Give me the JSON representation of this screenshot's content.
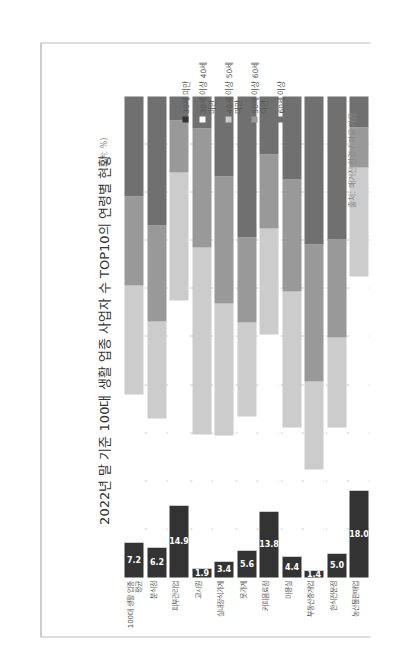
{
  "chart_data": {
    "type": "bar",
    "orientation": "horizontal-stacked (image rotated -90deg)",
    "title": "2022년 말 기준 100대 생활 업종 사업자 수 TOP10의 연령별 현황",
    "unit": "(단위: %)",
    "source": "출처: 매거진 한경 / 자료 가공",
    "xlabel": "",
    "ylabel": "",
    "xlim": [
      0,
      100
    ],
    "grid": true,
    "legend_position": "right",
    "categories": [
      "100대 생활 업종 평균",
      "분식점",
      "피부관리업",
      "고시원",
      "실내장식가게",
      "옷가게",
      "커피음료점",
      "미용실",
      "부동산중개업",
      "한식전문점",
      "농산물판매업"
    ],
    "series": [
      {
        "name": "30세 미만",
        "color": "#333333",
        "values": [
          7.2,
          6.2,
          14.9,
          1.9,
          3.4,
          5.6,
          13.8,
          4.4,
          1.4,
          5.0,
          18.0
        ],
        "labeled": true
      },
      {
        "name": "30세 이상 40세 미만",
        "color": "#ffffff",
        "values": [
          30.8,
          26.8,
          42.7,
          27.8,
          26.1,
          27.9,
          36.7,
          26.8,
          21.1,
          26.2,
          44.6
        ]
      },
      {
        "name": "40세 이상 50세 미만",
        "color": "#cccccc",
        "values": [
          22.7,
          20.2,
          26.6,
          38.9,
          27.5,
          19.5,
          22.1,
          28.3,
          18.2,
          18.7,
          22.6
        ]
      },
      {
        "name": "50세 이상 60세 미만",
        "color": "#999999",
        "values": [
          18.5,
          20.0,
          10.8,
          24.8,
          26.4,
          17.7,
          15.3,
          23.2,
          28.5,
          20.4,
          8.4
        ]
      },
      {
        "name": "60세 이상",
        "color": "#707070",
        "values": [
          20.8,
          26.8,
          5.0,
          6.6,
          16.6,
          29.3,
          12.1,
          17.3,
          30.8,
          29.7,
          6.4
        ]
      }
    ]
  }
}
